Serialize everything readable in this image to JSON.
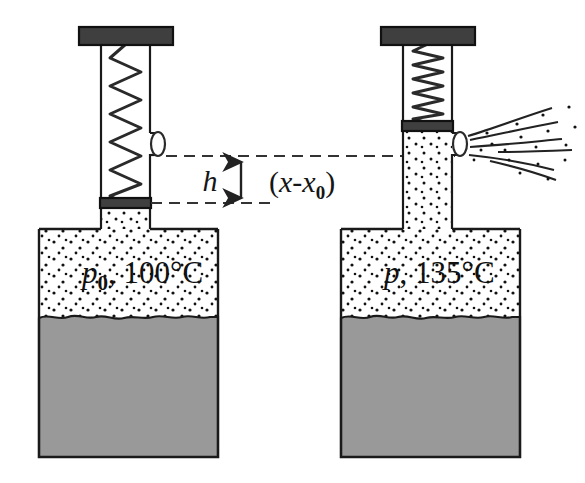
{
  "figure": {
    "type": "physics-diagram",
    "colors": {
      "outline": "#1a1a1a",
      "liquid_gray": "#999999",
      "plate_dark": "#3f3f3f",
      "dashed": "#333333",
      "background": "#ffffff"
    }
  },
  "left_apparatus": {
    "name": "initial-state-vessel",
    "vessel_label": "p₀, 100°C",
    "pressure_symbol": "p",
    "pressure_subscript": "0",
    "temperature": "100°C",
    "spring_state": "extended",
    "spring_coils": 11,
    "valve_state": "closed",
    "piston_position": "low"
  },
  "right_apparatus": {
    "name": "final-state-vessel",
    "vessel_label": "p, 135°C",
    "pressure_symbol": "p",
    "pressure_subscript": "",
    "temperature": "135°C",
    "spring_state": "compressed",
    "spring_coils": 10,
    "valve_state": "open",
    "piston_position": "high",
    "jet_label": "escaping vapor jet"
  },
  "annotations": {
    "height_label": "h",
    "displacement_label": "(x-x₀)",
    "displacement_open_paren": "(",
    "displacement_x": "x",
    "displacement_minus": "-",
    "displacement_x0_base": "x",
    "displacement_x0_sub": "0",
    "displacement_close_paren": ")",
    "arrow_name": "double-headed-vertical-arrow",
    "upper_dashed_line": "piston level upper reference",
    "lower_dashed_line": "piston level lower reference"
  }
}
